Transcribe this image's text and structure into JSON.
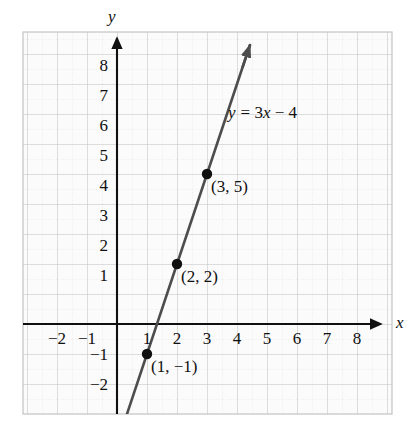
{
  "chart_data": {
    "type": "line",
    "title": "",
    "xlabel": "x",
    "ylabel": "y",
    "equation_label": "y = 3x − 4",
    "equation_parts": {
      "y": "y",
      "equals": "= 3",
      "x": "x",
      "rest": " − 4"
    },
    "slope": 3,
    "intercept": -4,
    "xlim": [
      -2.85,
      9.15
    ],
    "ylim": [
      -3.0,
      9.7
    ],
    "grid": true,
    "grid_major_step": 1,
    "grid_minor_step": 0.5,
    "legend": "none",
    "x_tick_labels": [
      "−2",
      "−1",
      "1",
      "2",
      "3",
      "4",
      "5",
      "6",
      "7",
      "8"
    ],
    "x_tick_values": [
      -2,
      -1,
      1,
      2,
      3,
      4,
      5,
      6,
      7,
      8
    ],
    "y_tick_labels": [
      "8",
      "7",
      "6",
      "5",
      "4",
      "3",
      "2",
      "1",
      "−1",
      "−2"
    ],
    "y_tick_values": [
      8,
      7,
      6,
      5,
      4,
      3,
      2,
      1,
      -1,
      -2
    ],
    "line_endpoints": [
      {
        "x": 0.233,
        "y": -3.3
      },
      {
        "x": 4.433,
        "y": 9.3
      }
    ],
    "points": [
      {
        "x": 1,
        "y": -1,
        "label": "(1, −1)"
      },
      {
        "x": 2,
        "y": 2,
        "label": "(2, 2)"
      },
      {
        "x": 3,
        "y": 5,
        "label": "(3, 5)"
      }
    ],
    "colors": {
      "line": "#4d4d4d",
      "point": "#101010",
      "axis": "#101010",
      "grid_major": "#c9c9c9",
      "grid_minor": "#d8d8d8",
      "plot_background": "#fbfbfb",
      "text": "#101010"
    }
  }
}
